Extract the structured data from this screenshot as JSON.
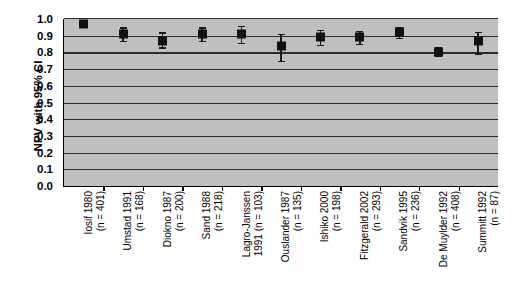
{
  "chart_data": {
    "type": "scatter",
    "title": "",
    "xlabel": "",
    "ylabel": "NPV with 95% CI",
    "ylim": [
      0.0,
      1.0
    ],
    "ytick_labels": [
      "1.0",
      "0.9",
      "0.8",
      "0.7",
      "0.6",
      "0.5",
      "0.4",
      "0.3",
      "0.2",
      "0.1",
      "0.0"
    ],
    "ytick_values": [
      1.0,
      0.9,
      0.8,
      0.7,
      0.6,
      0.5,
      0.4,
      0.3,
      0.2,
      0.1,
      0.0
    ],
    "grid": true,
    "legend": "none",
    "plot_background": "#bfbfbf",
    "marker_color": "#111111",
    "categories": [
      "Iosif 1980 (n = 401)",
      "Umstad 1991 (n = 168)",
      "Diokno 1987 (n = 200)",
      "Sand 1988 (n = 218)",
      "Lagro-Janssen 1991 (n = 103)",
      "Ouslander 1987 (n = 135)",
      "Ishiko 2000 (n = 198)",
      "Fitzgerald 2002 (n = 293)",
      "Sandvik 1995 (n = 236)",
      "De Muylder 1992 (n = 408)",
      "Summitt 1992 (n = 87)"
    ],
    "points": [
      {
        "study": "Iosif",
        "year": 1980,
        "n": 401,
        "label_line1": "Iosif 1980",
        "label_line2": "(n = 401)",
        "npv": 0.97,
        "ci_low": 0.955,
        "ci_high": 0.985
      },
      {
        "study": "Umstad",
        "year": 1991,
        "n": 168,
        "label_line1": "Umstad 1991",
        "label_line2": "(n = 168)",
        "npv": 0.91,
        "ci_low": 0.87,
        "ci_high": 0.95
      },
      {
        "study": "Diokno",
        "year": 1987,
        "n": 200,
        "label_line1": "Diokno 1987",
        "label_line2": "(n = 200)",
        "npv": 0.87,
        "ci_low": 0.83,
        "ci_high": 0.92
      },
      {
        "study": "Sand",
        "year": 1988,
        "n": 218,
        "label_line1": "Sand 1988",
        "label_line2": "(n = 218)",
        "npv": 0.91,
        "ci_low": 0.87,
        "ci_high": 0.95
      },
      {
        "study": "Lagro-Janssen",
        "year": 1991,
        "n": 103,
        "label_line1": "Lagro-Janssen",
        "label_line2": "1991 (n = 103)",
        "npv": 0.91,
        "ci_low": 0.855,
        "ci_high": 0.96
      },
      {
        "study": "Ouslander",
        "year": 1987,
        "n": 135,
        "label_line1": "Ouslander 1987",
        "label_line2": "(n = 135)",
        "npv": 0.84,
        "ci_low": 0.75,
        "ci_high": 0.91
      },
      {
        "study": "Ishiko",
        "year": 2000,
        "n": 198,
        "label_line1": "Ishiko 2000",
        "label_line2": "(n = 198)",
        "npv": 0.89,
        "ci_low": 0.845,
        "ci_high": 0.935
      },
      {
        "study": "Fitzgerald",
        "year": 2002,
        "n": 293,
        "label_line1": "Fitzgerald 2002",
        "label_line2": "(n = 293)",
        "npv": 0.89,
        "ci_low": 0.85,
        "ci_high": 0.93
      },
      {
        "study": "Sandvik",
        "year": 1995,
        "n": 236,
        "label_line1": "Sandvik 1995",
        "label_line2": "(n = 236)",
        "npv": 0.92,
        "ci_low": 0.885,
        "ci_high": 0.955
      },
      {
        "study": "De Muylder",
        "year": 1992,
        "n": 408,
        "label_line1": "De Muylder 1992",
        "label_line2": "(n = 408)",
        "npv": 0.805,
        "ci_low": 0.78,
        "ci_high": 0.835
      },
      {
        "study": "Summitt",
        "year": 1992,
        "n": 87,
        "label_line1": "Summitt 1992",
        "label_line2": "(n = 87)",
        "npv": 0.87,
        "ci_low": 0.79,
        "ci_high": 0.925
      }
    ]
  }
}
